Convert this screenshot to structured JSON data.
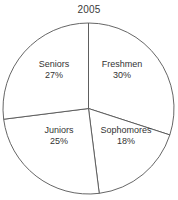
{
  "chart_data": {
    "type": "pie",
    "title": "2005",
    "xlabel": "",
    "ylabel": "",
    "legend": "none",
    "grid": false,
    "start_angle_deg": 0,
    "direction": "clockwise",
    "categories": [
      "Freshmen",
      "Sophomores",
      "Juniors",
      "Seniors"
    ],
    "values": [
      30,
      18,
      25,
      27
    ],
    "value_unit": "%",
    "labels": [
      "30%",
      "18%",
      "25%",
      "27%"
    ],
    "slices": [
      {
        "name": "Freshmen",
        "value": 30,
        "label": "30%",
        "start_deg": 0,
        "end_deg": 108,
        "label_x": 122,
        "label_y": 70
      },
      {
        "name": "Sophomores",
        "value": 18,
        "label": "18%",
        "start_deg": 108,
        "end_deg": 172.8,
        "label_x": 126,
        "label_y": 136
      },
      {
        "name": "Juniors",
        "value": 25,
        "label": "25%",
        "start_deg": 172.8,
        "end_deg": 262.8,
        "label_x": 59,
        "label_y": 136
      },
      {
        "name": "Seniors",
        "value": 27,
        "label": "27%",
        "start_deg": 262.8,
        "end_deg": 360,
        "label_x": 54,
        "label_y": 70
      }
    ],
    "colors": {
      "background": "#ffffff",
      "slice_fill": "#ffffff",
      "slice_stroke": "#555555",
      "text": "#333333",
      "title": "#3a3a3a"
    },
    "geometry": {
      "center_x": 88.5,
      "center_y": 108.5,
      "radius": 85.5
    }
  }
}
